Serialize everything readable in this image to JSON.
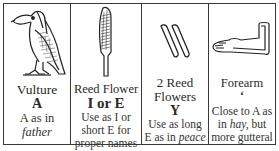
{
  "panels": [
    {
      "icon": "vulture-hieroglyph-icon",
      "name": "Vulture",
      "letter": "A",
      "desc_prefix": "A as in",
      "desc_italic": "father",
      "desc_suffix": ""
    },
    {
      "icon": "reed-flower-hieroglyph-icon",
      "name": "Reed Flower",
      "letter": "I or E",
      "desc_line1": "Use as I or",
      "desc_line2": "short E for",
      "desc_line3": "proper names"
    },
    {
      "icon": "two-reed-flowers-hieroglyph-icon",
      "name_line1": "2 Reed",
      "name_line2": "Flowers",
      "letter": "Y",
      "desc_line1": "Use as long",
      "desc_prefix": "E as in",
      "desc_italic": "peace"
    },
    {
      "icon": "forearm-hieroglyph-icon",
      "name": "Forearm",
      "letter": "ʻ",
      "desc_line1": "Close to A as",
      "desc_prefix": "in",
      "desc_italic": "hay,",
      "desc_suffix": "but",
      "desc_line3": "more gutteral"
    }
  ]
}
